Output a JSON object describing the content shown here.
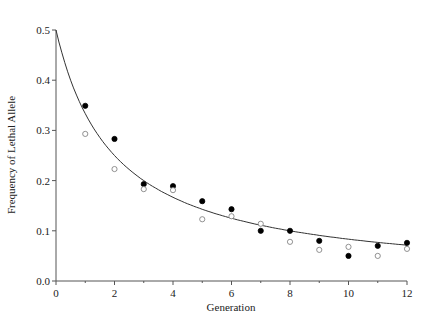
{
  "chart_data": {
    "type": "scatter",
    "title": "",
    "xlabel": "Generation",
    "ylabel": "Frequency of Lethal Allele",
    "xlim": [
      0,
      12
    ],
    "ylim": [
      0,
      0.5
    ],
    "x_ticks": [
      "0",
      "2",
      "4",
      "6",
      "8",
      "10",
      "12"
    ],
    "y_ticks": [
      "0.0",
      "0.1",
      "0.2",
      "0.3",
      "0.4",
      "0.5"
    ],
    "grid": false,
    "legend": null,
    "series": [
      {
        "name": "Observed (filled circles)",
        "marker": "filled-circle",
        "x": [
          1,
          2,
          3,
          4,
          5,
          6,
          7,
          8,
          9,
          10,
          11,
          12
        ],
        "y": [
          0.349,
          0.283,
          0.193,
          0.189,
          0.159,
          0.143,
          0.1,
          0.1,
          0.08,
          0.05,
          0.07,
          0.076
        ]
      },
      {
        "name": "Observed (open circles)",
        "marker": "open-circle",
        "x": [
          1,
          2,
          3,
          4,
          5,
          6,
          7,
          8,
          9,
          10,
          11,
          12
        ],
        "y": [
          0.293,
          0.223,
          0.183,
          0.181,
          0.123,
          0.129,
          0.114,
          0.078,
          0.062,
          0.068,
          0.05,
          0.064
        ]
      },
      {
        "name": "Expected q = q0 / (1 + n q0), q0 = 0.5",
        "marker": "line",
        "x": [
          0,
          0.5,
          1,
          1.5,
          2,
          3,
          4,
          5,
          6,
          7,
          8,
          9,
          10,
          11,
          12
        ],
        "y": [
          0.5,
          0.4,
          0.333,
          0.286,
          0.25,
          0.2,
          0.167,
          0.143,
          0.125,
          0.111,
          0.1,
          0.091,
          0.083,
          0.077,
          0.071
        ]
      }
    ]
  }
}
